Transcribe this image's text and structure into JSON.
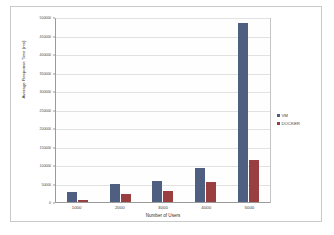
{
  "chart_data": {
    "type": "bar",
    "title": "",
    "xlabel": "Number of Users",
    "ylabel": "Average Response Time (ms)",
    "categories": [
      "1000",
      "2000",
      "3000",
      "4000",
      "5000"
    ],
    "series": [
      {
        "name": "VM",
        "color": "#4f5f82",
        "values": [
          28000,
          50000,
          58000,
          92000,
          483000
        ]
      },
      {
        "name": "DOCKER",
        "color": "#9a3f3f",
        "values": [
          6000,
          22000,
          31000,
          53000,
          114000
        ]
      }
    ],
    "ylim": [
      0,
      500000
    ],
    "ytick_step": 50000,
    "yticks": [
      "0",
      "50000",
      "100000",
      "150000",
      "200000",
      "250000",
      "300000",
      "350000",
      "400000",
      "450000",
      "500000"
    ],
    "grid": true,
    "legend_position": "right"
  },
  "legend": {
    "items": [
      {
        "label": "VM",
        "marker": "square-marker-blue"
      },
      {
        "label": "DOCKER",
        "marker": "square-marker-red"
      }
    ]
  }
}
